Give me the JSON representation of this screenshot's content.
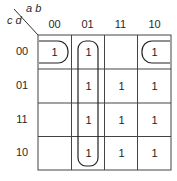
{
  "kmap": {
    "row_var": "c d",
    "col_var": "a b",
    "col_headers": [
      "00",
      "01",
      "11",
      "10"
    ],
    "row_headers": [
      "00",
      "01",
      "11",
      "10"
    ],
    "cells": [
      [
        "1",
        "1",
        "",
        "1"
      ],
      [
        "",
        "1",
        "1",
        "1"
      ],
      [
        "",
        "1",
        "1",
        "1"
      ],
      [
        "",
        "1",
        "1",
        "1"
      ]
    ],
    "groupings": [
      {
        "name": "column-01-vertical-group",
        "cells": "col 01, rows 00-10"
      },
      {
        "name": "corner-wraparound-group",
        "cells": "row 00, cols 00 and 10"
      }
    ]
  }
}
